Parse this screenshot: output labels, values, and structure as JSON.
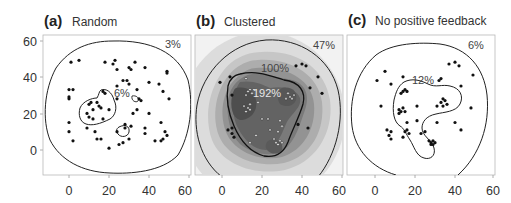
{
  "chart_data": [
    {
      "type": "scatter",
      "panel": "(a)",
      "title": "Random",
      "xlabel": "",
      "ylabel": "",
      "xlim": [
        -12,
        62
      ],
      "ylim": [
        -13,
        62
      ],
      "xticks": [
        0,
        20,
        40,
        60
      ],
      "yticks": [
        0,
        20,
        40,
        60
      ],
      "grid": false,
      "contours": [
        {
          "label": "3%",
          "level": 3
        },
        {
          "label": "6%",
          "level": 6
        }
      ],
      "points": [
        [
          1,
          48
        ],
        [
          5,
          49
        ],
        [
          18,
          48
        ],
        [
          22,
          47
        ],
        [
          23,
          49
        ],
        [
          24,
          44
        ],
        [
          30,
          45
        ],
        [
          31,
          44
        ],
        [
          33,
          48
        ],
        [
          38,
          45
        ],
        [
          49,
          43
        ],
        [
          49,
          42
        ],
        [
          0,
          33
        ],
        [
          2,
          33
        ],
        [
          0,
          28
        ],
        [
          0,
          29
        ],
        [
          17,
          32
        ],
        [
          18,
          31
        ],
        [
          24,
          35
        ],
        [
          27,
          38
        ],
        [
          29,
          38
        ],
        [
          30,
          36
        ],
        [
          34,
          33
        ],
        [
          40,
          37
        ],
        [
          45,
          36
        ],
        [
          47,
          32
        ],
        [
          50,
          28
        ],
        [
          24,
          28
        ],
        [
          35,
          28
        ],
        [
          36,
          27
        ],
        [
          10,
          25
        ],
        [
          11,
          26
        ],
        [
          14,
          26
        ],
        [
          15,
          24
        ],
        [
          16,
          23
        ],
        [
          20,
          22
        ],
        [
          12,
          22
        ],
        [
          9,
          20
        ],
        [
          10,
          18
        ],
        [
          12,
          17
        ],
        [
          17,
          17
        ],
        [
          28,
          14
        ],
        [
          31,
          13
        ],
        [
          32,
          20
        ],
        [
          34,
          22
        ],
        [
          40,
          20
        ],
        [
          38,
          12
        ],
        [
          38,
          9
        ],
        [
          46,
          15
        ],
        [
          48,
          10
        ],
        [
          49,
          8
        ],
        [
          0,
          15
        ],
        [
          0,
          10
        ],
        [
          2,
          5
        ],
        [
          13,
          10
        ],
        [
          14,
          6
        ],
        [
          16,
          6
        ],
        [
          20,
          1
        ],
        [
          25,
          3
        ],
        [
          27,
          4
        ],
        [
          30,
          6
        ],
        [
          24,
          10
        ],
        [
          43,
          5
        ],
        [
          46,
          5
        ],
        [
          47,
          6
        ],
        [
          28,
          12
        ],
        [
          9,
          12
        ]
      ]
    },
    {
      "type": "heatmap",
      "panel": "(b)",
      "title": "Clustered",
      "xlabel": "",
      "ylabel": "",
      "xlim": [
        -12,
        62
      ],
      "ylim": [
        -13,
        62
      ],
      "xticks": [
        0,
        20,
        40,
        60
      ],
      "yticks": [
        0,
        20,
        40,
        60
      ],
      "grid": false,
      "contours": [
        {
          "label": "47%",
          "level": 47
        },
        {
          "label": "100%",
          "level": 100
        },
        {
          "label": "192%",
          "level": 192
        }
      ],
      "points_black": [
        [
          37,
          46
        ],
        [
          40,
          47
        ],
        [
          42,
          46
        ],
        [
          4,
          40
        ],
        [
          -1,
          37
        ],
        [
          48,
          40
        ],
        [
          44,
          34
        ],
        [
          5,
          30
        ],
        [
          50,
          31
        ],
        [
          38,
          14
        ],
        [
          43,
          12
        ],
        [
          3,
          11
        ],
        [
          5,
          12
        ],
        [
          5,
          9
        ],
        [
          6,
          7
        ]
      ],
      "points_white": [
        [
          12,
          39
        ],
        [
          14,
          33
        ],
        [
          13,
          32
        ],
        [
          15,
          31
        ],
        [
          12,
          30
        ],
        [
          16,
          33
        ],
        [
          33,
          31
        ],
        [
          34,
          29
        ],
        [
          35,
          28
        ],
        [
          32,
          28
        ],
        [
          36,
          30
        ],
        [
          11,
          24
        ],
        [
          13,
          23
        ],
        [
          14,
          22
        ],
        [
          12,
          21
        ],
        [
          14,
          25
        ],
        [
          18,
          26
        ],
        [
          20,
          17
        ],
        [
          23,
          17
        ],
        [
          29,
          16
        ],
        [
          24,
          11
        ],
        [
          28,
          10
        ],
        [
          30,
          13
        ],
        [
          17,
          8
        ],
        [
          14,
          4
        ],
        [
          26,
          6
        ],
        [
          27,
          4
        ],
        [
          29,
          5
        ],
        [
          30,
          4
        ],
        [
          28,
          3
        ]
      ]
    },
    {
      "type": "scatter",
      "panel": "(c)",
      "title": "No positive feedback",
      "xlabel": "",
      "ylabel": "",
      "xlim": [
        -12,
        62
      ],
      "ylim": [
        -13,
        62
      ],
      "xticks": [
        0,
        20,
        40,
        60
      ],
      "yticks": [
        0,
        20,
        40,
        60
      ],
      "grid": false,
      "contours": [
        {
          "label": "6%",
          "level": 6
        },
        {
          "label": "12%",
          "level": 12
        }
      ],
      "points": [
        [
          5,
          43
        ],
        [
          37,
          47
        ],
        [
          40,
          48
        ],
        [
          42,
          46
        ],
        [
          49,
          41
        ],
        [
          1,
          38
        ],
        [
          14,
          40
        ],
        [
          8,
          36
        ],
        [
          32,
          38
        ],
        [
          33,
          39
        ],
        [
          43,
          35
        ],
        [
          14,
          32
        ],
        [
          15,
          33
        ],
        [
          13,
          31
        ],
        [
          16,
          32
        ],
        [
          34,
          28
        ],
        [
          35,
          27
        ],
        [
          33,
          26
        ],
        [
          36,
          25
        ],
        [
          34,
          24
        ],
        [
          31,
          24
        ],
        [
          3,
          24
        ],
        [
          12,
          22
        ],
        [
          13,
          21
        ],
        [
          14,
          23
        ],
        [
          15,
          21
        ],
        [
          12,
          20
        ],
        [
          21,
          24
        ],
        [
          16,
          15
        ],
        [
          21,
          16
        ],
        [
          31,
          15
        ],
        [
          40,
          15
        ],
        [
          48,
          23
        ],
        [
          43,
          11
        ],
        [
          8,
          10
        ],
        [
          6,
          11
        ],
        [
          7,
          8
        ],
        [
          8,
          6
        ],
        [
          15,
          10
        ],
        [
          16,
          11
        ],
        [
          17,
          9
        ],
        [
          14,
          7
        ],
        [
          23,
          9
        ],
        [
          25,
          10
        ],
        [
          27,
          5
        ],
        [
          28,
          4
        ],
        [
          29,
          5
        ],
        [
          30,
          4
        ],
        [
          28,
          3
        ],
        [
          29,
          3
        ]
      ]
    }
  ],
  "panels": [
    {
      "letter": "(a)",
      "title": "Random",
      "outer_label": "3%",
      "inner_label": "6%"
    },
    {
      "letter": "(b)",
      "title": "Clustered",
      "outer_label": "47%",
      "mid_label": "100%",
      "inner_label": "192%"
    },
    {
      "letter": "(c)",
      "title": "No positive feedback",
      "outer_label": "6%",
      "inner_label": "12%"
    }
  ],
  "axes": {
    "x_ticks": [
      "0",
      "20",
      "40",
      "60"
    ],
    "y_ticks": [
      "60",
      "40",
      "20",
      "0"
    ]
  },
  "colors": {
    "frame": "#b8b8b8",
    "contour": "#222222",
    "point": "#111111",
    "heat_levels": [
      "#f0f0f0",
      "#dedede",
      "#c8c8c8",
      "#b0b0b0",
      "#949494",
      "#7a7a7a",
      "#5e5e5e",
      "#474747"
    ]
  }
}
